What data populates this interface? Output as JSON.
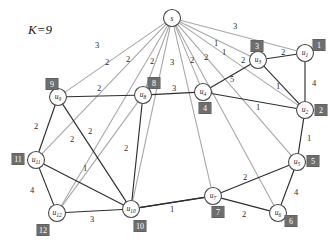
{
  "figure": {
    "k_label": "K=9",
    "type": "weighted-graph-diagram",
    "background": "#ffffff",
    "edge_dark_color": "#2e2e2e",
    "edge_light_color": "#a8a8a8",
    "badge_color": "#6e6e6e",
    "badge_text_color": "#ffffff"
  },
  "nodes": [
    {
      "id": "s",
      "label": "s",
      "sub": "",
      "x": 172,
      "y": 18,
      "r": 8.5,
      "badge": null,
      "badge_x": 0,
      "badge_y": 0
    },
    {
      "id": "u1",
      "label": "u",
      "sub": "1",
      "x": 305,
      "y": 53,
      "r": 8.5,
      "badge": "1",
      "badge_x": 319,
      "badge_y": 45
    },
    {
      "id": "u2",
      "label": "u",
      "sub": "2",
      "x": 305,
      "y": 110,
      "r": 8.5,
      "badge": "2",
      "badge_x": 321,
      "badge_y": 110
    },
    {
      "id": "u3",
      "label": "u",
      "sub": "3",
      "x": 258,
      "y": 60,
      "r": 8.5,
      "badge": "3",
      "badge_x": 257,
      "badge_y": 46
    },
    {
      "id": "u4",
      "label": "u",
      "sub": "4",
      "x": 203,
      "y": 92,
      "r": 8.5,
      "badge": "4",
      "badge_x": 205,
      "badge_y": 108
    },
    {
      "id": "u5",
      "label": "u",
      "sub": "5",
      "x": 297,
      "y": 162,
      "r": 8.5,
      "badge": "5",
      "badge_x": 313,
      "badge_y": 161
    },
    {
      "id": "u6",
      "label": "u",
      "sub": "6",
      "x": 278,
      "y": 213,
      "r": 8.5,
      "badge": "6",
      "badge_x": 291,
      "badge_y": 221
    },
    {
      "id": "u7",
      "label": "u",
      "sub": "7",
      "x": 213,
      "y": 196,
      "r": 8.5,
      "badge": "7",
      "badge_x": 218,
      "badge_y": 212
    },
    {
      "id": "u8",
      "label": "u",
      "sub": "8",
      "x": 143,
      "y": 95,
      "r": 8.5,
      "badge": "8",
      "badge_x": 154,
      "badge_y": 83
    },
    {
      "id": "u9",
      "label": "u",
      "sub": "9",
      "x": 58,
      "y": 97,
      "r": 8.5,
      "badge": "9",
      "badge_x": 52,
      "badge_y": 84
    },
    {
      "id": "u10",
      "label": "u",
      "sub": "10",
      "x": 131,
      "y": 209,
      "r": 8.5,
      "badge": "10",
      "badge_x": 140,
      "badge_y": 226
    },
    {
      "id": "u11",
      "label": "u",
      "sub": "11",
      "x": 36,
      "y": 160,
      "r": 8.5,
      "badge": "11",
      "badge_x": 18,
      "badge_y": 159
    },
    {
      "id": "u12",
      "label": "u",
      "sub": "12",
      "x": 57,
      "y": 213,
      "r": 8.5,
      "badge": "12",
      "badge_x": 43,
      "badge_y": 230
    }
  ],
  "edges": [
    {
      "from": "s",
      "to": "u9",
      "weight": "3",
      "style": "light",
      "lx": 97,
      "ly": 45
    },
    {
      "from": "s",
      "to": "u11",
      "weight": "2",
      "style": "light",
      "lx": 72,
      "ly": 139
    },
    {
      "from": "s",
      "to": "u8",
      "weight": "2",
      "style": "light",
      "lx": 128,
      "ly": 59
    },
    {
      "from": "s",
      "to": "u12",
      "weight": "2",
      "style": "light",
      "lx": 107,
      "ly": 62
    },
    {
      "from": "s",
      "to": "u10",
      "weight": "2",
      "style": "light",
      "lx": 152,
      "ly": 61
    },
    {
      "from": "s",
      "to": "u4",
      "weight": "3",
      "style": "light",
      "lx": 172,
      "ly": 62
    },
    {
      "from": "s",
      "to": "u7",
      "weight": "2",
      "style": "light",
      "lx": 192,
      "ly": 60
    },
    {
      "from": "s",
      "to": "u6",
      "weight": "2",
      "style": "light",
      "lx": 206,
      "ly": 57
    },
    {
      "from": "s",
      "to": "u3",
      "weight": "1",
      "style": "light",
      "lx": 216,
      "ly": 43
    },
    {
      "from": "s",
      "to": "u5",
      "weight": "1",
      "style": "light",
      "lx": 224,
      "ly": 52
    },
    {
      "from": "s",
      "to": "u1",
      "weight": "3",
      "style": "light",
      "lx": 235,
      "ly": 26
    },
    {
      "from": "s",
      "to": "u2",
      "weight": "2",
      "style": "light",
      "lx": 243,
      "ly": 60
    },
    {
      "from": "u9",
      "to": "u8",
      "weight": "2",
      "style": "dark",
      "lx": 99,
      "ly": 88
    },
    {
      "from": "u8",
      "to": "u4",
      "weight": "3",
      "style": "dark",
      "lx": 174,
      "ly": 88
    },
    {
      "from": "u4",
      "to": "u3",
      "weight": "5",
      "style": "dark",
      "lx": 232,
      "ly": 79
    },
    {
      "from": "u3",
      "to": "u1",
      "weight": "2",
      "style": "dark",
      "lx": 283,
      "ly": 52
    },
    {
      "from": "u3",
      "to": "u2",
      "weight": "1",
      "style": "dark",
      "lx": 278,
      "ly": 86
    },
    {
      "from": "u1",
      "to": "u2",
      "weight": "4",
      "style": "dark",
      "lx": 314,
      "ly": 83
    },
    {
      "from": "u4",
      "to": "u2",
      "weight": "1",
      "style": "dark",
      "lx": 258,
      "ly": 107
    },
    {
      "from": "u2",
      "to": "u5",
      "weight": "1",
      "style": "dark",
      "lx": 309,
      "ly": 138
    },
    {
      "from": "u5",
      "to": "u7",
      "weight": "2",
      "style": "dark",
      "lx": 245,
      "ly": 177
    },
    {
      "from": "u5",
      "to": "u6",
      "weight": "4",
      "style": "dark",
      "lx": 296,
      "ly": 192
    },
    {
      "from": "u7",
      "to": "u6",
      "weight": "2",
      "style": "dark",
      "lx": 244,
      "ly": 214
    },
    {
      "from": "u7",
      "to": "u10",
      "weight": "1",
      "style": "dark",
      "lx": 172,
      "ly": 209
    },
    {
      "from": "u9",
      "to": "u11",
      "weight": "2",
      "style": "dark",
      "lx": 36,
      "ly": 126
    },
    {
      "from": "u9",
      "to": "u10",
      "weight": "2",
      "style": "dark",
      "lx": 90,
      "ly": 131
    },
    {
      "from": "u8",
      "to": "u10",
      "weight": "2",
      "style": "dark",
      "lx": 126,
      "ly": 148
    },
    {
      "from": "u8",
      "to": "u12",
      "weight": "",
      "style": "light",
      "lx": 0,
      "ly": 0
    },
    {
      "from": "u11",
      "to": "u10",
      "weight": "1",
      "style": "dark",
      "lx": 85,
      "ly": 168
    },
    {
      "from": "u11",
      "to": "u12",
      "weight": "4",
      "style": "dark",
      "lx": 32,
      "ly": 190
    },
    {
      "from": "u12",
      "to": "u10",
      "weight": "3",
      "style": "dark",
      "lx": 92,
      "ly": 219
    },
    {
      "from": "u10",
      "to": "u7",
      "weight": "",
      "style": "dark",
      "lx": 0,
      "ly": 0
    }
  ]
}
